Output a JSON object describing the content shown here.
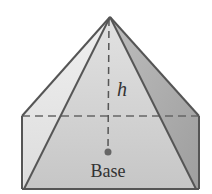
{
  "diagram": {
    "type": "pyramid-on-box",
    "labels": {
      "height": "h",
      "base": "Base"
    },
    "colors": {
      "stroke": "#555555",
      "left_face": "#e4e4e4",
      "front_face": "#cccccc",
      "right_face": "#a9a9a9",
      "box_front": "#d6d6d6",
      "box_right": "#b8b8b8",
      "dot": "#666666"
    }
  }
}
